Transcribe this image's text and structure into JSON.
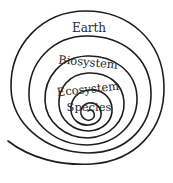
{
  "diagram": {
    "type": "spiral",
    "levels": [
      {
        "label": "Species",
        "order": 1
      },
      {
        "label": "Ecosystem",
        "order": 2
      },
      {
        "label": "Biosystem",
        "order": 3
      },
      {
        "label": "Earth",
        "order": 4
      }
    ],
    "labels": {
      "earth": "Earth",
      "biosystem": "Biosystem",
      "ecosystem": "Ecosystem",
      "species": "Species"
    },
    "stroke_color": "#1e1e1e",
    "text_color": "#2a2a2a"
  }
}
